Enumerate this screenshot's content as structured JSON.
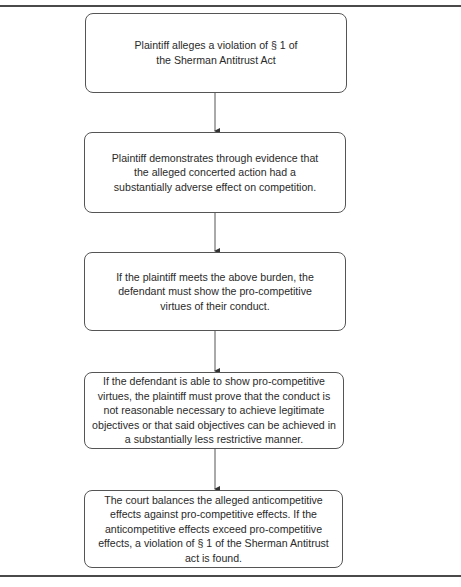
{
  "diagram": {
    "type": "flowchart",
    "direction": "top-to-bottom",
    "steps": [
      {
        "id": "step1",
        "text": "Plaintiff alleges a violation of § 1 of the Sherman Antitrust Act"
      },
      {
        "id": "step2",
        "text": "Plaintiff demonstrates through evidence that the alleged concerted action had a substantially adverse effect on competition."
      },
      {
        "id": "step3",
        "text": "If the plaintiff meets the above burden, the defendant must show the pro-competitive virtues of their conduct."
      },
      {
        "id": "step4",
        "text": "If the defendant is able to show pro-competitive virtues, the plaintiff must prove that the conduct is not reasonable necessary to achieve legitimate objectives or that said objectives can be achieved in a substantially less restrictive manner."
      },
      {
        "id": "step5",
        "text": "The court balances the alleged anticompetitive effects against pro-competitive effects. If the anticompetitive effects exceed pro-competitive effects, a violation of § 1 of the Sherman Antitrust act is found."
      }
    ],
    "edges": [
      {
        "from": "step1",
        "to": "step2"
      },
      {
        "from": "step2",
        "to": "step3"
      },
      {
        "from": "step3",
        "to": "step4"
      },
      {
        "from": "step4",
        "to": "step5"
      }
    ],
    "colors": {
      "stroke": "#555555",
      "text": "#2a2a2a",
      "rule": "#4a4a4a"
    }
  }
}
